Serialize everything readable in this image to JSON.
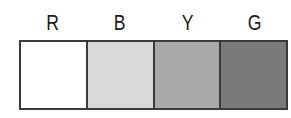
{
  "swatches": [
    {
      "label": "R",
      "color": "#ffffff"
    },
    {
      "label": "B",
      "color": "#d9d9d9"
    },
    {
      "label": "Y",
      "color": "#a9a9a9"
    },
    {
      "label": "G",
      "color": "#7a7a7a"
    }
  ]
}
